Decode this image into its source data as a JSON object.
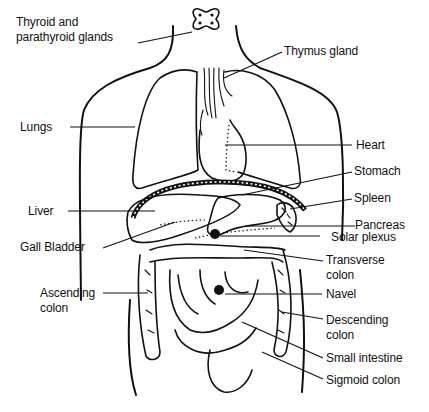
{
  "diagram": {
    "labels": [
      {
        "id": "thyroid",
        "text_lines": [
          "Thyroid and",
          "parathyroid glands"
        ]
      },
      {
        "id": "thymus",
        "text_lines": [
          "Thymus gland"
        ]
      },
      {
        "id": "lungs",
        "text_lines": [
          "Lungs"
        ]
      },
      {
        "id": "heart",
        "text_lines": [
          "Heart"
        ]
      },
      {
        "id": "stomach",
        "text_lines": [
          "Stomach"
        ]
      },
      {
        "id": "liver",
        "text_lines": [
          "Liver"
        ]
      },
      {
        "id": "spleen",
        "text_lines": [
          "Spleen"
        ]
      },
      {
        "id": "pancreas",
        "text_lines": [
          "Pancreas"
        ]
      },
      {
        "id": "gall_bladder",
        "text_lines": [
          "Gall Bladder"
        ]
      },
      {
        "id": "solar_plexus",
        "text_lines": [
          "Solar plexus"
        ]
      },
      {
        "id": "transverse_colon",
        "text_lines": [
          "Transverse",
          "colon"
        ]
      },
      {
        "id": "ascending_colon",
        "text_lines": [
          "Ascending",
          "colon"
        ]
      },
      {
        "id": "navel",
        "text_lines": [
          "Navel"
        ]
      },
      {
        "id": "descending_colon",
        "text_lines": [
          "Descending",
          "colon"
        ]
      },
      {
        "id": "small_intestine",
        "text_lines": [
          "Small intestine"
        ]
      },
      {
        "id": "sigmoid_colon",
        "text_lines": [
          "Sigmoid colon"
        ]
      }
    ],
    "colors": {
      "line": "#111111",
      "background": "#ffffff"
    }
  }
}
